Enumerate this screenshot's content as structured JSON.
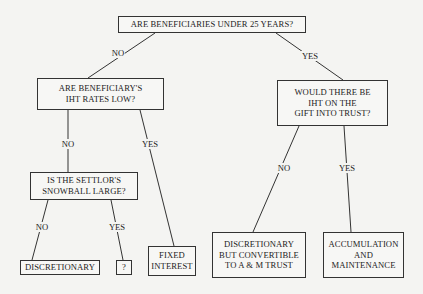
{
  "diagram": {
    "type": "decision-tree",
    "nodes": {
      "root": {
        "label": "ARE BENEFICIARIES UNDER 25 YEARS?"
      },
      "iht_rates_low": {
        "label": "ARE BENEFICIARY'S\nIHT RATES LOW?"
      },
      "iht_on_gift": {
        "label": "WOULD THERE BE\nIHT ON THE\nGIFT INTO TRUST?"
      },
      "snowball_large": {
        "label": "IS THE SETTLOR'S\nSNOWBALL LARGE?"
      },
      "fixed_interest": {
        "label": "FIXED\nINTEREST"
      },
      "discretionary": {
        "label": "DISCRETIONARY"
      },
      "unknown": {
        "label": "?"
      },
      "disc_convertible": {
        "label": "DISCRETIONARY\nBUT CONVERTIBLE\nTO A & M TRUST"
      },
      "accumulation": {
        "label": "ACCUMULATION\nAND\nMAINTENANCE"
      }
    },
    "edges": [
      {
        "from": "root",
        "to": "iht_rates_low",
        "label": "NO"
      },
      {
        "from": "root",
        "to": "iht_on_gift",
        "label": "YES"
      },
      {
        "from": "iht_rates_low",
        "to": "snowball_large",
        "label": "NO"
      },
      {
        "from": "iht_rates_low",
        "to": "fixed_interest",
        "label": "YES"
      },
      {
        "from": "snowball_large",
        "to": "discretionary",
        "label": "NO"
      },
      {
        "from": "snowball_large",
        "to": "unknown",
        "label": "YES"
      },
      {
        "from": "iht_on_gift",
        "to": "disc_convertible",
        "label": "NO"
      },
      {
        "from": "iht_on_gift",
        "to": "accumulation",
        "label": "YES"
      }
    ]
  }
}
